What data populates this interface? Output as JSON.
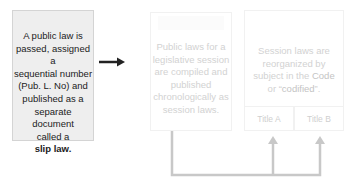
{
  "diagram": {
    "step1": {
      "lines": [
        "A public law is",
        "passed, assigned a",
        "sequential number",
        "(Pub. L. No) and",
        "published as a",
        "separate document",
        "called a"
      ],
      "bold_term": "slip law."
    },
    "step2": {
      "lines": [
        "Public laws for a",
        "legislative session",
        "are compiled and",
        "published",
        "chronologically as",
        "session laws."
      ]
    },
    "step3": {
      "lines": [
        "Session laws are",
        "reorganized by"
      ],
      "line3_prefix": "subject in the ",
      "line3_highlight": "Code",
      "line4_prefix": "or “",
      "line4_highlight": "codified",
      "line4_suffix": "”."
    },
    "titles": [
      "Title A",
      "Title B"
    ],
    "colors": {
      "step1_fill": "#eeeeee",
      "step1_border": "#d4d4d4",
      "arrow_dark": "#222222",
      "connector": "#c8c8c8",
      "faded_text": "#d2d2d2"
    }
  }
}
